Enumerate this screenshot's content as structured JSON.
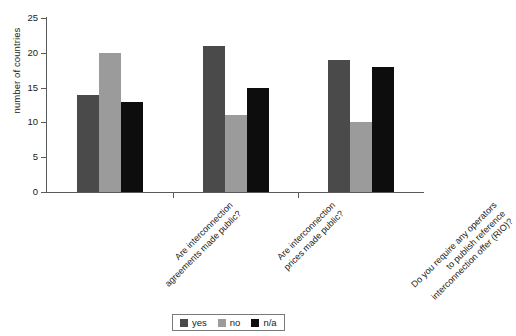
{
  "chart_data": {
    "type": "bar",
    "title": "",
    "subtitle": "",
    "xlabel": "",
    "ylabel": "number of countries",
    "ylim": [
      0,
      25
    ],
    "yticks": [
      0,
      5,
      10,
      15,
      20,
      25
    ],
    "ytick_labels": [
      "0",
      "5",
      "10",
      "15",
      "20",
      "25"
    ],
    "grid": false,
    "legend_position": "bottom-center",
    "categories": [
      "Are interconnection agreements made public?",
      "Are interconnection prices made public?",
      "Do you require any operators to publish reference interconnection offer (RIO)?"
    ],
    "category_lines": [
      [
        "Are interconnection",
        "agreements made public?"
      ],
      [
        "Are interconnection",
        "prices made public?"
      ],
      [
        "Do you require any operators",
        "to publish reference",
        "interconnection offer (RIO)?"
      ]
    ],
    "series": [
      {
        "name": "yes",
        "color": "#4a4a4a",
        "values": [
          14,
          21,
          19
        ]
      },
      {
        "name": "no",
        "color": "#9b9b9b",
        "values": [
          20,
          11,
          10
        ]
      },
      {
        "name": "n/a",
        "color": "#0d0d0d",
        "values": [
          13,
          15,
          18
        ]
      }
    ],
    "legend": [
      {
        "label": "yes",
        "color": "#4a4a4a"
      },
      {
        "label": "no",
        "color": "#9b9b9b"
      },
      {
        "label": "n/a",
        "color": "#0d0d0d"
      }
    ]
  }
}
